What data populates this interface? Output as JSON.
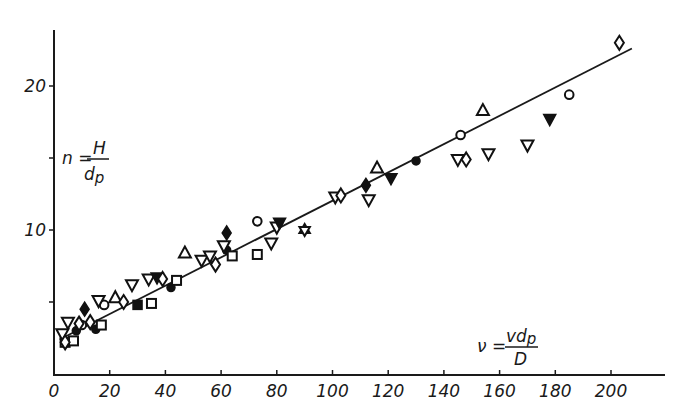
{
  "chart_data": {
    "type": "scatter",
    "title": "",
    "xlabel": "ν = v·d_p / D",
    "ylabel": "n = H / d_p",
    "x_label_parts": {
      "lhs": "ν =",
      "num": "vd",
      "num_sub": "p",
      "den": "D"
    },
    "y_label_parts": {
      "lhs": "n =",
      "num": "H",
      "den": "d",
      "den_sub": "p"
    },
    "xlim": [
      0,
      220
    ],
    "ylim": [
      0,
      24
    ],
    "x_ticks": [
      0,
      20,
      40,
      60,
      80,
      100,
      120,
      140,
      160,
      180,
      200
    ],
    "x_tick_labels": [
      "0",
      "20",
      "40",
      "60",
      "80",
      "100",
      "120",
      "140",
      "160",
      "180",
      "200"
    ],
    "y_ticks": [
      5,
      10,
      15,
      20
    ],
    "y_tick_labels": [
      "",
      "10",
      "",
      "20"
    ],
    "grid": false,
    "legend": null,
    "fit_line": {
      "x": [
        2,
        207.5
      ],
      "y": [
        2.4,
        22.6
      ]
    },
    "series": [
      {
        "name": "open circle",
        "marker": "circle",
        "filled": false,
        "points": [
          [
            10,
            3.4
          ],
          [
            18,
            4.8
          ],
          [
            73,
            10.6
          ],
          [
            146,
            16.6
          ],
          [
            185,
            19.4
          ]
        ]
      },
      {
        "name": "filled circle",
        "marker": "circle",
        "filled": true,
        "points": [
          [
            8,
            3.0
          ],
          [
            15,
            3.1
          ],
          [
            42,
            6.0
          ],
          [
            62,
            8.6
          ],
          [
            130,
            14.8
          ]
        ]
      },
      {
        "name": "open square",
        "marker": "square",
        "filled": false,
        "points": [
          [
            4,
            2.2
          ],
          [
            7,
            2.3
          ],
          [
            17,
            3.4
          ],
          [
            35,
            4.9
          ],
          [
            44,
            6.5
          ],
          [
            64,
            8.2
          ],
          [
            73,
            8.3
          ]
        ]
      },
      {
        "name": "filled square",
        "marker": "square",
        "filled": true,
        "points": [
          [
            30,
            4.8
          ]
        ]
      },
      {
        "name": "open triangle up",
        "marker": "triangle-up",
        "filled": false,
        "points": [
          [
            22,
            5.3
          ],
          [
            47,
            8.4
          ],
          [
            116,
            14.3
          ],
          [
            154,
            18.3
          ]
        ]
      },
      {
        "name": "open triangle down",
        "marker": "triangle-down",
        "filled": false,
        "points": [
          [
            3,
            2.8
          ],
          [
            5,
            3.6
          ],
          [
            16,
            5.1
          ],
          [
            28,
            6.2
          ],
          [
            34,
            6.6
          ],
          [
            53,
            7.9
          ],
          [
            56,
            8.2
          ],
          [
            61,
            8.9
          ],
          [
            78,
            9.1
          ],
          [
            80,
            10.2
          ],
          [
            101,
            12.3
          ],
          [
            113,
            12.1
          ],
          [
            145,
            14.9
          ],
          [
            156,
            15.3
          ],
          [
            170,
            15.9
          ]
        ]
      },
      {
        "name": "filled triangle down",
        "marker": "triangle-down",
        "filled": true,
        "points": [
          [
            37,
            6.7
          ],
          [
            81,
            10.5
          ],
          [
            121,
            13.6
          ],
          [
            178,
            17.7
          ]
        ]
      },
      {
        "name": "open diamond",
        "marker": "diamond",
        "filled": false,
        "points": [
          [
            4,
            2.2
          ],
          [
            9,
            3.5
          ],
          [
            13,
            3.6
          ],
          [
            25,
            5.0
          ],
          [
            39,
            6.6
          ],
          [
            58,
            7.6
          ],
          [
            103,
            12.4
          ],
          [
            148,
            14.9
          ],
          [
            203,
            23.0
          ]
        ]
      },
      {
        "name": "filled diamond",
        "marker": "diamond",
        "filled": true,
        "points": [
          [
            11,
            4.5
          ],
          [
            62,
            9.8
          ],
          [
            112,
            13.1
          ]
        ]
      },
      {
        "name": "star of David",
        "marker": "hexagram",
        "filled": false,
        "points": [
          [
            90,
            10.0
          ]
        ]
      }
    ]
  }
}
